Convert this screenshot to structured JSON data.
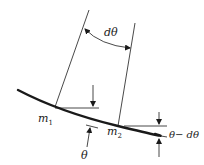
{
  "diagram": {
    "type": "physics-curvature-diagram",
    "colors": {
      "ink": "#1a1a1a",
      "background": "#ffffff"
    },
    "labels": {
      "angle_increment": "dθ",
      "point1": {
        "base": "m",
        "sub": "1"
      },
      "point2": {
        "base": "m",
        "sub": "2"
      },
      "angle1": "θ",
      "angle2": "θ− dθ"
    },
    "elements": [
      "curved path (thick)",
      "normal line at m1",
      "normal line at m2",
      "double-headed arc arrow between normals labeled dθ",
      "horizontal reference at m1 with down arrow",
      "tangent indicator at m1 with up arrow labeled θ",
      "horizontal reference at m2 with down arrow",
      "tangent indicator at m2 with up arrow labeled θ− dθ"
    ]
  }
}
